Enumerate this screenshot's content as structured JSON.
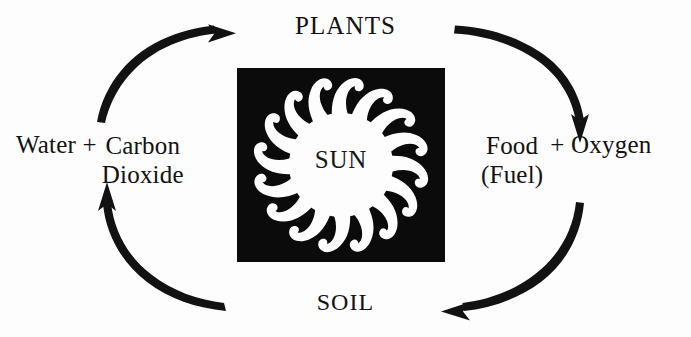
{
  "diagram": {
    "background_color": "#fdfdfd",
    "ink_color": "#121212",
    "panel_color": "#0b0b0b",
    "sun_color": "#fdfdfd"
  },
  "nodes": {
    "top": "PLANTS",
    "bottom": "SOIL",
    "center": "SUN"
  },
  "left_group": {
    "lead": "Water +",
    "stack": [
      "Carbon",
      "Dioxide"
    ]
  },
  "right_group": {
    "stack": [
      "Food",
      "(Fuel)"
    ],
    "trail": "+ Oxygen"
  },
  "arrows": [
    {
      "name": "arrow-left-to-plants",
      "from": "Water + Carbon Dioxide",
      "to": "PLANTS",
      "direction": "up-right",
      "head": "right"
    },
    {
      "name": "arrow-plants-to-right",
      "from": "PLANTS",
      "to": "Food (Fuel) + Oxygen",
      "direction": "down-right",
      "head": "down"
    },
    {
      "name": "arrow-right-to-soil",
      "from": "Food (Fuel) + Oxygen",
      "to": "SOIL",
      "direction": "down-left",
      "head": "left"
    },
    {
      "name": "arrow-soil-to-left",
      "from": "SOIL",
      "to": "Water + Carbon Dioxide",
      "direction": "up-left",
      "head": "up"
    }
  ],
  "sun_graphic": {
    "ray_count": 16,
    "style": "curved flame rays",
    "disc_label": "SUN"
  }
}
